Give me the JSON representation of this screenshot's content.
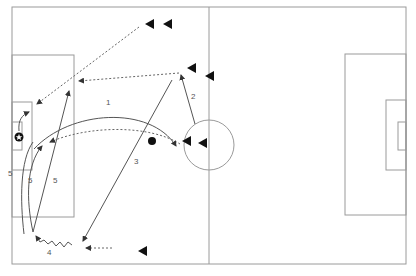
{
  "diagram": {
    "colors": {
      "pitch_lines": "#9a9a9a",
      "movement": "#555555",
      "players": "#111111",
      "background": "#ffffff"
    },
    "pitch": {
      "outer": {
        "x": 12,
        "y": 7,
        "w": 394,
        "h": 257
      },
      "halfway_x": 209,
      "centre_circle": {
        "cx": 209,
        "cy": 145,
        "r": 25
      },
      "left_penalty_box": {
        "x": 12,
        "y": 55,
        "w": 62,
        "h": 162
      },
      "left_goal_box": {
        "x": 12,
        "y": 102,
        "w": 20,
        "h": 68
      },
      "left_goal": {
        "x": 12,
        "y": 122,
        "w": 10,
        "h": 28
      },
      "right_penalty_box": {
        "x": 345,
        "y": 54,
        "w": 61,
        "h": 161
      },
      "right_goal_box": {
        "x": 386,
        "y": 100,
        "w": 20,
        "h": 70
      },
      "right_goal": {
        "x": 398,
        "y": 122,
        "w": 8,
        "h": 28
      }
    },
    "players": [
      {
        "id": "p1",
        "x": 150,
        "y": 24
      },
      {
        "id": "p2",
        "x": 168,
        "y": 24
      },
      {
        "id": "p3",
        "x": 192,
        "y": 68
      },
      {
        "id": "p4",
        "x": 210,
        "y": 76
      },
      {
        "id": "p5",
        "x": 187,
        "y": 141
      },
      {
        "id": "p6",
        "x": 203,
        "y": 143
      },
      {
        "id": "p7",
        "x": 143,
        "y": 251
      }
    ],
    "ball": {
      "x": 152,
      "y": 141,
      "r": 4
    },
    "goalkeeper_icon": {
      "x": 19,
      "y": 137,
      "symbol": "star-ball-icon"
    },
    "labels": [
      {
        "text": "1",
        "x": 106,
        "y": 105
      },
      {
        "text": "2",
        "x": 191,
        "y": 99
      },
      {
        "text": "3",
        "x": 134,
        "y": 164
      },
      {
        "text": "4",
        "x": 47,
        "y": 255
      },
      {
        "text": "5",
        "x": 8,
        "y": 176
      },
      {
        "text": "5",
        "x": 28,
        "y": 183
      },
      {
        "text": "5",
        "x": 53,
        "y": 183
      }
    ],
    "legend": {
      "solid_arrow": "pass / ball movement",
      "dashed_arrow": "player run",
      "wavy_arrow": "dribble"
    }
  }
}
